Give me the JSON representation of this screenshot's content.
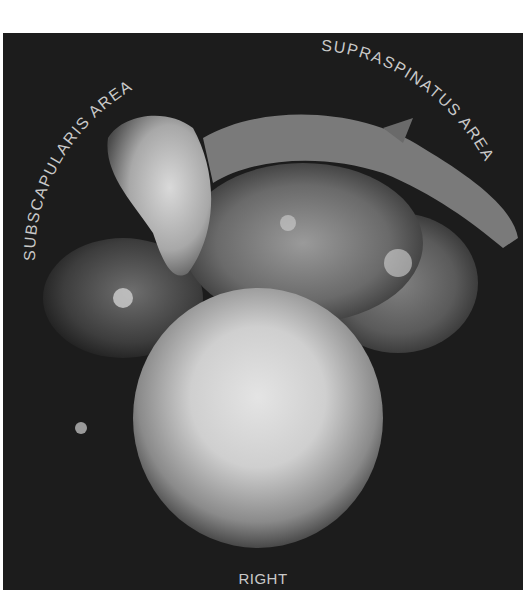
{
  "figure": {
    "type": "anatomical-photograph",
    "labels": {
      "subscapularis": "SUBSCAPULARIS AREA",
      "supraspinatus": "SUPRASPINATUS AREA",
      "side": "RIGHT"
    },
    "colors": {
      "background": "#1c1c1c",
      "label": "#c9c9c9",
      "page": "#ffffff"
    }
  }
}
